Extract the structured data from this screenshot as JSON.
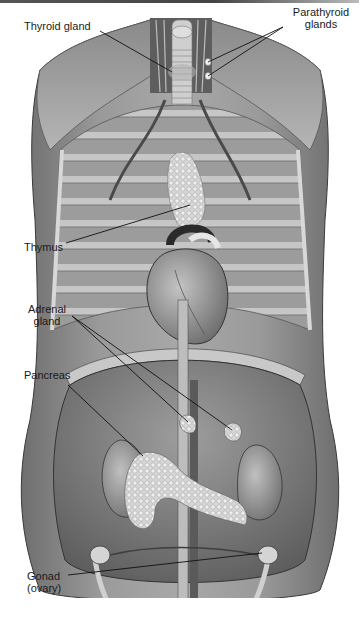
{
  "figure": {
    "labels": {
      "thyroid": "Thyroid gland",
      "parathyroid_line1": "Parathyroid",
      "parathyroid_line2": "glands",
      "thymus": "Thymus",
      "adrenal_line1": "Adrenal",
      "adrenal_line2": "gland",
      "pancreas": "Pancreas",
      "gonad_line1": "Gonad",
      "gonad_line2": "(ovary)"
    },
    "colors": {
      "background": "#ffffff",
      "label_text": "#1a1a1a",
      "leader_line": "#111111",
      "tissue_dark": "#5a5a5a",
      "tissue_mid": "#8c8c8c",
      "tissue_light": "#c8c8c8",
      "gland_light": "#e2e2e2"
    }
  }
}
